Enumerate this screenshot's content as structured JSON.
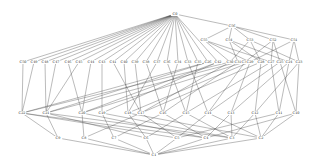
{
  "diagram": {
    "type": "concept-lattice",
    "nodes": [
      {
        "id": "C0",
        "x": 175,
        "y": 14
      },
      {
        "id": "C56",
        "x": 232,
        "y": 26
      },
      {
        "id": "C55",
        "x": 204,
        "y": 40
      },
      {
        "id": "C54",
        "x": 229,
        "y": 40
      },
      {
        "id": "C53",
        "x": 250,
        "y": 40
      },
      {
        "id": "C52",
        "x": 273,
        "y": 40
      },
      {
        "id": "C51",
        "x": 294,
        "y": 40
      },
      {
        "id": "C50",
        "x": 23,
        "y": 62
      },
      {
        "id": "C49",
        "x": 34,
        "y": 62
      },
      {
        "id": "C48",
        "x": 45,
        "y": 62
      },
      {
        "id": "C47",
        "x": 56,
        "y": 62
      },
      {
        "id": "C46",
        "x": 68,
        "y": 62
      },
      {
        "id": "C45",
        "x": 79,
        "y": 62
      },
      {
        "id": "C44",
        "x": 91,
        "y": 62
      },
      {
        "id": "C43",
        "x": 102,
        "y": 62
      },
      {
        "id": "C41",
        "x": 113,
        "y": 62
      },
      {
        "id": "C40",
        "x": 124,
        "y": 62
      },
      {
        "id": "C39",
        "x": 135,
        "y": 62
      },
      {
        "id": "C38",
        "x": 146,
        "y": 62
      },
      {
        "id": "C37",
        "x": 157,
        "y": 62
      },
      {
        "id": "C36",
        "x": 167,
        "y": 62
      },
      {
        "id": "C34",
        "x": 178,
        "y": 62
      },
      {
        "id": "C33",
        "x": 188,
        "y": 62
      },
      {
        "id": "C35",
        "x": 198,
        "y": 62
      },
      {
        "id": "C26",
        "x": 208,
        "y": 62
      },
      {
        "id": "C42",
        "x": 218,
        "y": 62
      },
      {
        "id": "C30",
        "x": 230,
        "y": 62
      },
      {
        "id": "C31",
        "x": 238,
        "y": 62
      },
      {
        "id": "C32",
        "x": 245,
        "y": 62
      },
      {
        "id": "C29",
        "x": 250,
        "y": 62
      },
      {
        "id": "C28",
        "x": 261,
        "y": 62
      },
      {
        "id": "C27",
        "x": 271,
        "y": 62
      },
      {
        "id": "C25",
        "x": 280,
        "y": 62
      },
      {
        "id": "C24",
        "x": 289,
        "y": 62
      },
      {
        "id": "C23",
        "x": 299,
        "y": 62
      },
      {
        "id": "C22",
        "x": 22,
        "y": 113
      },
      {
        "id": "C21",
        "x": 46,
        "y": 113
      },
      {
        "id": "C20",
        "x": 82,
        "y": 113
      },
      {
        "id": "C19",
        "x": 102,
        "y": 113
      },
      {
        "id": "C18",
        "x": 128,
        "y": 113
      },
      {
        "id": "C17",
        "x": 141,
        "y": 113
      },
      {
        "id": "C16",
        "x": 163,
        "y": 113
      },
      {
        "id": "C15",
        "x": 186,
        "y": 113
      },
      {
        "id": "C14",
        "x": 208,
        "y": 113
      },
      {
        "id": "C13",
        "x": 231,
        "y": 113
      },
      {
        "id": "C12",
        "x": 255,
        "y": 113
      },
      {
        "id": "C11",
        "x": 279,
        "y": 113
      },
      {
        "id": "C10",
        "x": 296,
        "y": 113
      },
      {
        "id": "C9",
        "x": 58,
        "y": 138
      },
      {
        "id": "C8",
        "x": 84,
        "y": 138
      },
      {
        "id": "C7",
        "x": 114,
        "y": 138
      },
      {
        "id": "C6",
        "x": 146,
        "y": 138
      },
      {
        "id": "C5",
        "x": 177,
        "y": 138
      },
      {
        "id": "C4",
        "x": 206,
        "y": 138
      },
      {
        "id": "C3",
        "x": 232,
        "y": 138
      },
      {
        "id": "C2",
        "x": 261,
        "y": 138
      },
      {
        "id": "C1",
        "x": 154,
        "y": 155
      }
    ],
    "edges": [
      [
        "C0",
        "C56"
      ],
      [
        "C0",
        "C50"
      ],
      [
        "C0",
        "C49"
      ],
      [
        "C0",
        "C48"
      ],
      [
        "C0",
        "C47"
      ],
      [
        "C0",
        "C46"
      ],
      [
        "C0",
        "C45"
      ],
      [
        "C0",
        "C44"
      ],
      [
        "C0",
        "C43"
      ],
      [
        "C0",
        "C41"
      ],
      [
        "C0",
        "C40"
      ],
      [
        "C0",
        "C39"
      ],
      [
        "C0",
        "C38"
      ],
      [
        "C0",
        "C37"
      ],
      [
        "C0",
        "C36"
      ],
      [
        "C0",
        "C34"
      ],
      [
        "C0",
        "C33"
      ],
      [
        "C0",
        "C35"
      ],
      [
        "C0",
        "C26"
      ],
      [
        "C0",
        "C42"
      ],
      [
        "C56",
        "C55"
      ],
      [
        "C56",
        "C54"
      ],
      [
        "C56",
        "C53"
      ],
      [
        "C56",
        "C52"
      ],
      [
        "C56",
        "C51"
      ],
      [
        "C55",
        "C30"
      ],
      [
        "C55",
        "C29"
      ],
      [
        "C55",
        "C27"
      ],
      [
        "C54",
        "C31"
      ],
      [
        "C54",
        "C28"
      ],
      [
        "C54",
        "C24"
      ],
      [
        "C53",
        "C30"
      ],
      [
        "C53",
        "C28"
      ],
      [
        "C53",
        "C23"
      ],
      [
        "C52",
        "C32"
      ],
      [
        "C52",
        "C25"
      ],
      [
        "C52",
        "C27"
      ],
      [
        "C51",
        "C29"
      ],
      [
        "C51",
        "C24"
      ],
      [
        "C51",
        "C23"
      ],
      [
        "C50",
        "C22"
      ],
      [
        "C49",
        "C22"
      ],
      [
        "C48",
        "C21"
      ],
      [
        "C47",
        "C21"
      ],
      [
        "C46",
        "C20"
      ],
      [
        "C45",
        "C21"
      ],
      [
        "C44",
        "C20"
      ],
      [
        "C43",
        "C19"
      ],
      [
        "C41",
        "C17"
      ],
      [
        "C40",
        "C18"
      ],
      [
        "C39",
        "C17"
      ],
      [
        "C38",
        "C16"
      ],
      [
        "C37",
        "C18"
      ],
      [
        "C36",
        "C15"
      ],
      [
        "C34",
        "C16"
      ],
      [
        "C33",
        "C14"
      ],
      [
        "C35",
        "C15"
      ],
      [
        "C26",
        "C22"
      ],
      [
        "C26",
        "C21"
      ],
      [
        "C42",
        "C20"
      ],
      [
        "C42",
        "C19"
      ],
      [
        "C30",
        "C22"
      ],
      [
        "C30",
        "C17"
      ],
      [
        "C31",
        "C21"
      ],
      [
        "C31",
        "C16"
      ],
      [
        "C32",
        "C20"
      ],
      [
        "C32",
        "C14"
      ],
      [
        "C29",
        "C18"
      ],
      [
        "C29",
        "C13"
      ],
      [
        "C28",
        "C17"
      ],
      [
        "C28",
        "C12"
      ],
      [
        "C27",
        "C15"
      ],
      [
        "C27",
        "C11"
      ],
      [
        "C25",
        "C14"
      ],
      [
        "C25",
        "C10"
      ],
      [
        "C24",
        "C13"
      ],
      [
        "C24",
        "C11"
      ],
      [
        "C23",
        "C12"
      ],
      [
        "C23",
        "C10"
      ],
      [
        "C22",
        "C9"
      ],
      [
        "C22",
        "C5"
      ],
      [
        "C22",
        "C4"
      ],
      [
        "C21",
        "C9"
      ],
      [
        "C21",
        "C6"
      ],
      [
        "C21",
        "C3"
      ],
      [
        "C20",
        "C8"
      ],
      [
        "C20",
        "C4"
      ],
      [
        "C19",
        "C7"
      ],
      [
        "C19",
        "C3"
      ],
      [
        "C18",
        "C6"
      ],
      [
        "C18",
        "C2"
      ],
      [
        "C17",
        "C8"
      ],
      [
        "C17",
        "C5"
      ],
      [
        "C16",
        "C7"
      ],
      [
        "C16",
        "C4"
      ],
      [
        "C15",
        "C6"
      ],
      [
        "C15",
        "C3"
      ],
      [
        "C14",
        "C5"
      ],
      [
        "C14",
        "C2"
      ],
      [
        "C13",
        "C4"
      ],
      [
        "C13",
        "C3"
      ],
      [
        "C12",
        "C3"
      ],
      [
        "C12",
        "C2"
      ],
      [
        "C11",
        "C2"
      ],
      [
        "C11",
        "C5"
      ],
      [
        "C10",
        "C2"
      ],
      [
        "C10",
        "C4"
      ],
      [
        "C9",
        "C1"
      ],
      [
        "C8",
        "C1"
      ],
      [
        "C7",
        "C1"
      ],
      [
        "C6",
        "C1"
      ],
      [
        "C5",
        "C1"
      ],
      [
        "C4",
        "C1"
      ],
      [
        "C3",
        "C1"
      ],
      [
        "C2",
        "C1"
      ]
    ]
  }
}
